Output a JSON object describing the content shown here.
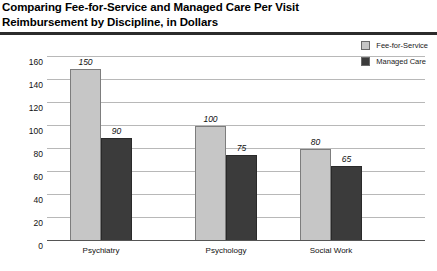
{
  "title": {
    "line1": "Comparing Fee-for-Service and Managed Care Per Visit",
    "line2": "Reimbursement by Discipline, in Dollars"
  },
  "legend": {
    "items": [
      {
        "label": "Fee-for-Service",
        "color": "#c6c6c6"
      },
      {
        "label": "Managed Care",
        "color": "#3b3b3b"
      }
    ]
  },
  "chart_data": {
    "type": "bar",
    "title": "Comparing Fee-for-Service and Managed Care Per Visit Reimbursement by Discipline, in Dollars",
    "xlabel": "",
    "ylabel": "",
    "categories": [
      "Psychiatry",
      "Psychology",
      "Social Work"
    ],
    "series": [
      {
        "name": "Fee-for-Service",
        "color": "#c6c6c6",
        "values": [
          150,
          100,
          80
        ]
      },
      {
        "name": "Managed Care",
        "color": "#3b3b3b",
        "values": [
          90,
          75,
          65
        ]
      }
    ],
    "ylim": [
      0,
      160
    ],
    "yticks": [
      0,
      20,
      40,
      60,
      80,
      100,
      120,
      140,
      160
    ],
    "ytick_labels": [
      "0",
      "20",
      "40",
      "60",
      "80",
      "100",
      "120",
      "140",
      "160"
    ],
    "grid": true,
    "legend_position": "top-right",
    "data_labels": {
      "Fee-for-Service": [
        "150",
        "100",
        "80"
      ],
      "Managed Care": [
        "90",
        "75",
        "65"
      ]
    }
  }
}
